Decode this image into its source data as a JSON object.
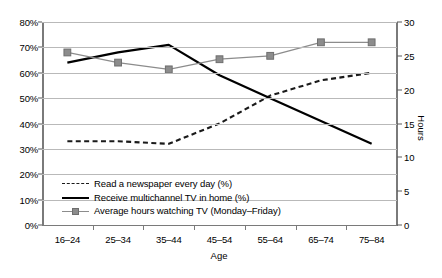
{
  "chart_data": {
    "type": "line",
    "title": "",
    "xlabel": "Age",
    "ylabel": "",
    "ylabel_right": "Hours",
    "categories": [
      "16–24",
      "25–34",
      "35–44",
      "45–54",
      "55–64",
      "65–74",
      "75–84"
    ],
    "ylim": [
      0,
      80
    ],
    "yticks": [
      "0%",
      "10%",
      "20%",
      "30%",
      "40%",
      "50%",
      "60%",
      "70%",
      "80%"
    ],
    "ytick_values": [
      0,
      10,
      20,
      30,
      40,
      50,
      60,
      70,
      80
    ],
    "ylim_right": [
      0,
      30
    ],
    "yticks_right": [
      "0",
      "5",
      "10",
      "15",
      "20",
      "25",
      "30"
    ],
    "ytick_values_right": [
      0,
      5,
      10,
      15,
      20,
      25,
      30
    ],
    "grid": true,
    "legend_position": "inside-lower-left",
    "series": [
      {
        "name": "Read a newspaper every day (%)",
        "axis": "left",
        "style": "dashed",
        "color": "#1a1a1a",
        "marker": "none",
        "values": [
          33,
          33,
          32,
          40,
          51,
          57,
          60
        ]
      },
      {
        "name": "Receive multichannel TV in home (%)",
        "axis": "left",
        "style": "solid",
        "color": "#000000",
        "marker": "none",
        "values": [
          64,
          68,
          71,
          59,
          50,
          41,
          32
        ]
      },
      {
        "name": "Average hours watching TV (Monday–Friday)",
        "axis": "right",
        "style": "solid",
        "color": "#8c8c8c",
        "marker": "square",
        "values": [
          25.5,
          24.0,
          23.0,
          24.5,
          25.0,
          27.0,
          27.0
        ]
      }
    ]
  }
}
